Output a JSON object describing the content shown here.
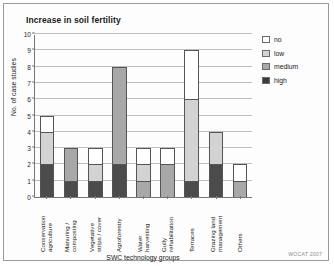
{
  "chart_data": {
    "type": "bar",
    "subtype": "stacked",
    "title": "Increase in soil fertility",
    "xlabel": "SWC technology groups",
    "ylabel": "No. of case studies",
    "ylim": [
      0,
      10
    ],
    "yticks": [
      0,
      1,
      2,
      3,
      4,
      5,
      6,
      7,
      8,
      9,
      10
    ],
    "grid": true,
    "legend_position": "right",
    "categories": [
      "Conservation agriculture",
      "Manuring / composting",
      "Vegetative strips / cover",
      "Agroforestry",
      "Water harvesting",
      "Gully rehabilitation",
      "Terraces",
      "Grazing land management",
      "Others"
    ],
    "category_lines": [
      [
        "Conservation",
        "agriculture"
      ],
      [
        "Manuring /",
        "composting"
      ],
      [
        "Vegetative",
        "strips / cover"
      ],
      [
        "Agroforestry"
      ],
      [
        "Water",
        "harvesting"
      ],
      [
        "Gully",
        "rehabilitation"
      ],
      [
        "Terraces"
      ],
      [
        "Grazing land",
        "management"
      ],
      [
        "Others"
      ]
    ],
    "series": [
      {
        "name": "high",
        "color": "#4b4b4b",
        "values": [
          2,
          1,
          1,
          2,
          0,
          0,
          1,
          2,
          0
        ]
      },
      {
        "name": "medium",
        "color": "#a8a8a8",
        "values": [
          0,
          2,
          0,
          6,
          1,
          2,
          0,
          0,
          1
        ]
      },
      {
        "name": "low",
        "color": "#d3d3d3",
        "values": [
          2,
          0,
          1,
          0,
          1,
          0,
          5,
          2,
          0
        ]
      },
      {
        "name": "no",
        "color": "#ffffff",
        "values": [
          1,
          0,
          1,
          0,
          1,
          1,
          3,
          0,
          1
        ]
      }
    ],
    "totals": [
      5,
      3,
      3,
      8,
      3,
      3,
      9,
      4,
      2
    ]
  },
  "legend": {
    "items": [
      {
        "key": "no",
        "label": "no"
      },
      {
        "key": "low",
        "label": "low"
      },
      {
        "key": "medium",
        "label": "medium"
      },
      {
        "key": "high",
        "label": "high"
      }
    ]
  },
  "credit": "WOCAT 2007"
}
